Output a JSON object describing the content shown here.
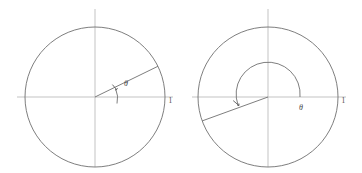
{
  "figure": {
    "background_color": "#ffffff",
    "stroke_color": "#6f6f6f",
    "axis_color": "#b4b4b4",
    "label_color": "#4a4a4a",
    "width": 362,
    "height": 173
  },
  "panels": [
    {
      "id": "left-panel",
      "name": "small-positive-angle",
      "center": {
        "x": 95,
        "y": 97
      },
      "radius": 70,
      "axis": {
        "horizontal": {
          "x1": 17,
          "y1": 97,
          "x2": 173,
          "y2": 97
        },
        "vertical": {
          "x1": 95,
          "y1": 9,
          "x2": 95,
          "y2": 167
        }
      },
      "radius_line": {
        "angle_degrees": 26,
        "x2": 158,
        "y2": 66
      },
      "arc": {
        "start_degrees": 0,
        "end_degrees": 26,
        "arc_radius": 30
      },
      "angle_label": {
        "text": "θ",
        "x": 124,
        "y": 85
      },
      "unit_label": {
        "text": "1",
        "x": 170,
        "y": 102
      }
    },
    {
      "id": "right-panel",
      "name": "large-reflex-angle",
      "center": {
        "x": 268,
        "y": 97
      },
      "radius": 70,
      "axis": {
        "horizontal": {
          "x1": 192,
          "y1": 97,
          "x2": 346,
          "y2": 97
        },
        "vertical": {
          "x1": 268,
          "y1": 9,
          "x2": 268,
          "y2": 167
        }
      },
      "radius_line": {
        "angle_degrees": 200,
        "x2": 202,
        "y2": 121
      },
      "arc": {
        "start_degrees": 0,
        "end_degrees": 200,
        "arc_radius": 36
      },
      "angle_label": {
        "text": "θ",
        "x": 300,
        "y": 108
      },
      "unit_label": {
        "text": "1",
        "x": 343,
        "y": 102
      }
    }
  ],
  "labels": {
    "theta": "θ",
    "unit": "1"
  }
}
